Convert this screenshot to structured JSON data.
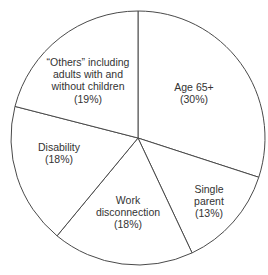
{
  "chart_data": {
    "type": "pie",
    "title": "",
    "subtitle": "",
    "xlabel": "",
    "ylabel": "",
    "legend": "none",
    "grid": false,
    "start_angle_deg": 0,
    "direction": "clockwise",
    "categories": [
      "Age 65+",
      "Single parent",
      "Work disconnection",
      "Disability",
      "“Others” including adults with and without children"
    ],
    "values": [
      30,
      13,
      18,
      18,
      19
    ],
    "unit": "%",
    "slices": [
      {
        "name": "age-65-plus",
        "label_lines": [
          "Age 65+",
          "(30%)"
        ],
        "value": 30,
        "percent_text": "(30%)",
        "start_deg": 0,
        "end_deg": 108,
        "color": "#ffffff"
      },
      {
        "name": "single-parent",
        "label_lines": [
          "Single",
          "parent",
          "(13%)"
        ],
        "value": 13,
        "percent_text": "(13%)",
        "start_deg": 108,
        "end_deg": 154.8,
        "color": "#ffffff"
      },
      {
        "name": "work-disconnection",
        "label_lines": [
          "Work",
          "disconnection",
          "(18%)"
        ],
        "value": 18,
        "percent_text": "(18%)",
        "start_deg": 154.8,
        "end_deg": 219.6,
        "color": "#ffffff"
      },
      {
        "name": "disability",
        "label_lines": [
          "Disability",
          "(18%)"
        ],
        "value": 18,
        "percent_text": "(18%)",
        "start_deg": 219.6,
        "end_deg": 284.4,
        "color": "#ffffff"
      },
      {
        "name": "others",
        "label_lines": [
          "“Others” including",
          "adults with and",
          "without children",
          "(19%)"
        ],
        "value": 19,
        "percent_text": "(19%)",
        "start_deg": 284.4,
        "end_deg": 360,
        "color": "#ffffff"
      }
    ],
    "style": {
      "slice_fill": "#ffffff",
      "outline_color": "#4a4a4a",
      "label_color": "#333333",
      "background": "#ffffff"
    },
    "geometry": {
      "center_x": 138,
      "center_y": 138,
      "radius": 127
    }
  }
}
